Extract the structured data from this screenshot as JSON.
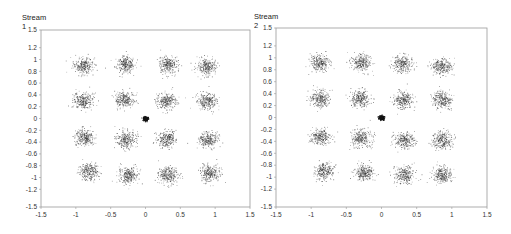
{
  "chart_data": [
    {
      "type": "scatter",
      "title": "Stream 1",
      "xlabel": "",
      "ylabel": "",
      "xlim": [
        -1.5,
        1.5
      ],
      "ylim": [
        -1.5,
        1.5
      ],
      "xticks": [
        -1.5,
        -1,
        -0.5,
        0,
        0.5,
        1,
        1.5
      ],
      "yticks": [
        1.5,
        1.2,
        1,
        0.8,
        0.6,
        0.4,
        0.2,
        0,
        -0.2,
        -0.4,
        -0.6,
        -0.8,
        -1,
        -1.2,
        -1.5
      ],
      "grid": false,
      "legend": null,
      "clusters": [
        {
          "x": -0.9,
          "y": 0.9
        },
        {
          "x": -0.3,
          "y": 0.92
        },
        {
          "x": 0.32,
          "y": 0.92
        },
        {
          "x": 0.88,
          "y": 0.88
        },
        {
          "x": -0.9,
          "y": 0.3
        },
        {
          "x": -0.3,
          "y": 0.32
        },
        {
          "x": 0.3,
          "y": 0.3
        },
        {
          "x": 0.88,
          "y": 0.3
        },
        {
          "x": -0.88,
          "y": -0.32
        },
        {
          "x": -0.28,
          "y": -0.35
        },
        {
          "x": 0.3,
          "y": -0.35
        },
        {
          "x": 0.9,
          "y": -0.35
        },
        {
          "x": -0.82,
          "y": -0.9
        },
        {
          "x": -0.25,
          "y": -0.95
        },
        {
          "x": 0.32,
          "y": -0.96
        },
        {
          "x": 0.92,
          "y": -0.92
        }
      ],
      "center_point": {
        "x": 0,
        "y": 0
      },
      "cluster_spread": 0.07,
      "points_per_cluster": 260
    },
    {
      "type": "scatter",
      "title": "Stream 2",
      "xlabel": "",
      "ylabel": "",
      "xlim": [
        -1.5,
        1.5
      ],
      "ylim": [
        -1.5,
        1.5
      ],
      "xticks": [
        -1.5,
        -1,
        -0.5,
        0,
        0.5,
        1,
        1.5
      ],
      "yticks": [
        1.5,
        1.2,
        1,
        0.8,
        0.6,
        0.4,
        0.2,
        0,
        -0.2,
        -0.4,
        -0.6,
        -0.8,
        -1,
        -1.2,
        -1.5
      ],
      "grid": false,
      "legend": null,
      "clusters": [
        {
          "x": -0.88,
          "y": 0.92
        },
        {
          "x": -0.3,
          "y": 0.92
        },
        {
          "x": 0.3,
          "y": 0.9
        },
        {
          "x": 0.86,
          "y": 0.86
        },
        {
          "x": -0.88,
          "y": 0.32
        },
        {
          "x": -0.3,
          "y": 0.32
        },
        {
          "x": 0.3,
          "y": 0.3
        },
        {
          "x": 0.86,
          "y": 0.3
        },
        {
          "x": -0.86,
          "y": -0.32
        },
        {
          "x": -0.3,
          "y": -0.34
        },
        {
          "x": 0.32,
          "y": -0.38
        },
        {
          "x": 0.86,
          "y": -0.38
        },
        {
          "x": -0.82,
          "y": -0.9
        },
        {
          "x": -0.25,
          "y": -0.92
        },
        {
          "x": 0.32,
          "y": -0.96
        },
        {
          "x": 0.86,
          "y": -0.96
        }
      ],
      "center_point": {
        "x": 0,
        "y": 0
      },
      "cluster_spread": 0.07,
      "points_per_cluster": 260
    }
  ],
  "panels": [
    {
      "title": "Stream 1"
    },
    {
      "title": "Stream 2"
    }
  ],
  "colors": {
    "points": "#333333",
    "frame": "#999999",
    "background": "#ffffff"
  }
}
